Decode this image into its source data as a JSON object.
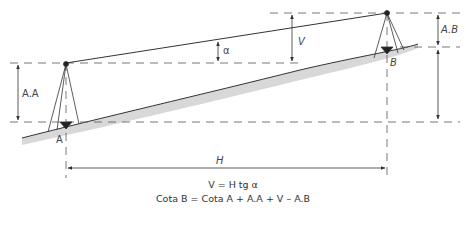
{
  "diagram": {
    "labels": {
      "station_a": "A",
      "station_b": "B",
      "instrument_height_a": "A.A",
      "signal_height_b": "A.B",
      "vertical_difference": "V",
      "horizontal_distance": "H",
      "angle": "α"
    },
    "formulas": {
      "line1": "V = H tg α",
      "line2": "Cota B = Cota A + A.A + V – A.B"
    },
    "colors": {
      "line": "#333333",
      "dash": "#555555",
      "terrain_fill": "#d8d8d8"
    }
  }
}
